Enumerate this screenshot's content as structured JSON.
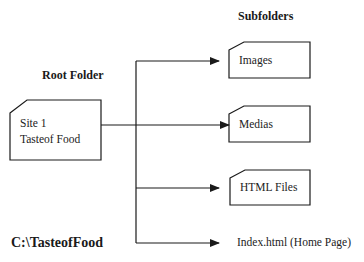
{
  "headings": {
    "root": "Root Folder",
    "subfolders": "Subfolders"
  },
  "root_folder": {
    "line1": "Site 1",
    "line2": "Tasteof Food",
    "path_label": "C:\\TasteofFood"
  },
  "subfolders": [
    {
      "label": "Images",
      "type": "folder"
    },
    {
      "label": "Medias",
      "type": "folder"
    },
    {
      "label": "HTML Files",
      "type": "folder"
    },
    {
      "label": "Index.html (Home Page)",
      "type": "file"
    }
  ],
  "colors": {
    "line": "#1a1a1a",
    "background": "#ffffff"
  }
}
